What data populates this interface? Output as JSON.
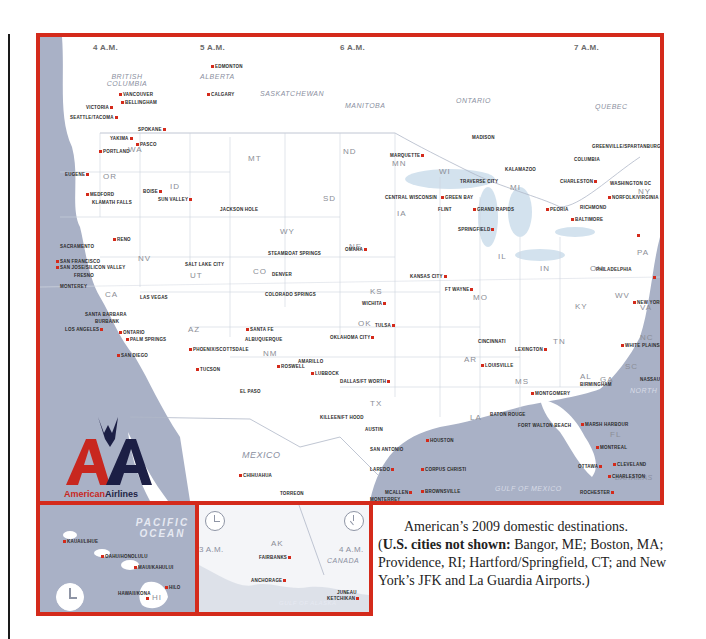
{
  "map": {
    "timezones": [
      "4 A.M.",
      "5 A.M.",
      "6 A.M.",
      "7 A.M."
    ],
    "regions": [
      "BRITISH COLUMBIA",
      "ALBERTA",
      "SASKATCHEWAN",
      "MANITOBA",
      "ONTARIO",
      "QUEBEC",
      "MEXICO",
      "GULF OF MEXICO",
      "BAHAMAS",
      "NORTH"
    ],
    "states": [
      "WA",
      "OR",
      "CA",
      "NV",
      "ID",
      "MT",
      "WY",
      "UT",
      "AZ",
      "CO",
      "NM",
      "ND",
      "SD",
      "NE",
      "KS",
      "OK",
      "TX",
      "MN",
      "IA",
      "MO",
      "AR",
      "LA",
      "WI",
      "IL",
      "MS",
      "MI",
      "IN",
      "KY",
      "TN",
      "AL",
      "OH",
      "GA",
      "FL",
      "WV",
      "VA",
      "NC",
      "SC",
      "PA",
      "NY",
      "VT",
      "NH",
      "MA",
      "CT",
      "RI",
      "NJ",
      "MD",
      "DE"
    ],
    "cities": [
      "EDMONTON",
      "CALGARY",
      "VANCOUVER",
      "BELLINGHAM",
      "VICTORIA",
      "SEATTLE/TACOMA",
      "SPOKANE",
      "YAKIMA",
      "PASCO",
      "PORTLAND",
      "EUGENE",
      "MEDFORD",
      "KLAMATH FALLS",
      "BOISE",
      "SUN VALLEY",
      "JACKSON HOLE",
      "RENO",
      "SACRAMENTO",
      "SAN FRANCISCO",
      "SAN JOSE/SILICON VALLEY",
      "FRESNO",
      "MONTEREY",
      "LAS VEGAS",
      "SANTA BARBARA",
      "BURBANK",
      "LOS ANGELES",
      "ONTARIO",
      "SANTA ANA ORANGE COUNTY JOHN WAYNE AIRPORT",
      "PALM SPRINGS",
      "SAN DIEGO",
      "PHOENIX/SCOTTSDALE",
      "TUCSON",
      "SALT LAKE CITY",
      "STEAMBOAT SPRINGS",
      "GRAND JUNCTION",
      "VAIL",
      "DENVER",
      "GUNNISON/CRESTED BUTTE",
      "COLORADO SPRINGS",
      "MONTROSE/TELLURIDE",
      "SANTA FE",
      "ALBUQUERQUE",
      "ROSWELL",
      "EL PASO",
      "OMAHA",
      "DES MOINES",
      "CEDAR RAPIDS/IOWA CITY",
      "DUBUQUE",
      "MOLINE/QUAD CITIES",
      "KANSAS CITY",
      "WICHITA",
      "TULSA",
      "OKLAHOMA CITY",
      "LAWTON/FT SILL",
      "WICHITA FALLS",
      "AMARILLO",
      "LUBBOCK",
      "DALLAS/FT WORTH",
      "MIDLAND/ODESSA",
      "ABILENE",
      "SAN ANGELO",
      "WACO",
      "KILLEEN/FT HOOD",
      "COLLEGE STATION/BRYAN",
      "AUSTIN",
      "SAN ANTONIO",
      "HOUSTON",
      "CORPUS CHRISTI",
      "LAREDO",
      "MCALLEN",
      "BROWNSVILLE",
      "CHIHUAHUA",
      "TORREON",
      "MONTERREY",
      "TYLER",
      "LONGVIEW",
      "TEXARKANA",
      "MINNEAPOLIS/ST PAUL",
      "ROCHESTER",
      "LA CROSSE",
      "MARQUETTE",
      "CENTRAL WISCONSIN",
      "GREEN BAY",
      "MADISON",
      "MILWAUKEE",
      "TRAVERSE CITY",
      "FLINT",
      "GRAND RAPIDS",
      "KALAMAZOO",
      "DETROIT",
      "TOLEDO",
      "CHICAGO",
      "PEORIA",
      "BLOOMINGTON",
      "SPRINGFIELD",
      "CHAMPAIGN/URBANA",
      "ST LOUIS",
      "SPRINGFIELD/BRANSON",
      "EVANSVILLE",
      "FT WAYNE",
      "INDIANAPOLIS",
      "COLUMBUS",
      "DAYTON",
      "CINCINNATI",
      "LOUISVILLE",
      "LEXINGTON",
      "FT SMITH",
      "FAYETTEVILLE/BENTONVILLE NW ARKANSAS AIRPORT",
      "LITTLE ROCK",
      "MEMPHIS",
      "NASHVILLE",
      "KNOXVILLE",
      "CHATTANOOGA",
      "HUNTSVILLE/DECATUR",
      "BIRMINGHAM",
      "MONTGOMERY",
      "ATLANTA",
      "JACKSON",
      "SHREVEPORT",
      "MONROE",
      "ALEXANDRIA",
      "BATON ROUGE",
      "LAFAYETTE",
      "LAKE CHARLES",
      "NEW ORLEANS",
      "GULFPORT",
      "MOBILE",
      "PENSACOLA",
      "FORT WALTON BEACH",
      "TALLAHASSEE",
      "SAVANNAH",
      "JACKSONVILLE",
      "ORLANDO",
      "TAMPA",
      "FT MYERS",
      "WEST PALM BEACH",
      "FORT LAUDERDALE",
      "MIAMI",
      "KEY WEST",
      "FREEPORT",
      "NASSAU",
      "MARSH HARBOUR",
      "MONTREAL",
      "OTTAWA",
      "TORONTO",
      "BUFFALO",
      "ROCHESTER",
      "SYRACUSE",
      "CLEVELAND",
      "PITTSBURGH",
      "CHARLESTON",
      "GREENSBORO/HIGH POINT/WINSTON-SALEM",
      "CHARLOTTE",
      "RALEIGH/DURHAM",
      "GREENVILLE/SPARTANBURG",
      "COLUMBIA",
      "CHARLESTON",
      "RICHMOND",
      "NORFOLK/VIRGINIA BEACH",
      "WASHINGTON DC",
      "BALTIMORE",
      "PHILADELPHIA",
      "NEWARK",
      "WHITE PLAINS/WESTCHESTER COUNTY",
      "NEW YORK",
      "HARTFORD"
    ]
  },
  "insets": {
    "hawaii": {
      "ocean_label": "PACIFIC OCEAN",
      "state": "HI",
      "cities": [
        "KAUAI/LIHUE",
        "OAHU/HONOLULU",
        "MAUI/KAHULUI",
        "HILO",
        "HAWAII/KONA"
      ]
    },
    "alaska": {
      "state": "AK",
      "time_left": "3 A.M.",
      "time_right": "4 A.M.",
      "region": "CANADA",
      "water": "GULF OF ALASKA",
      "cities": [
        "FAIRBANKS",
        "ANCHORAGE",
        "JUNEAU",
        "KETCHIKAN"
      ]
    }
  },
  "logo": {
    "letters": "AA",
    "wordmark_part1": "American",
    "wordmark_part2": "Airlines",
    "colors": {
      "red": "#c8271f",
      "navy": "#1c1f45"
    }
  },
  "caption": {
    "line1": "American’s 2009 domestic destinations.",
    "bold": "U.S. cities not shown:",
    "rest": " Bangor, ME; Boston, MA; Providence, RI; Hartford/Springfield, CT; and New York’s JFK and La Guardia Airports.)",
    "open_paren": "("
  },
  "colors": {
    "border": "#d42a1b",
    "water": "#a9b1c6",
    "land": "#ffffff",
    "dot": "#d42a1b"
  }
}
